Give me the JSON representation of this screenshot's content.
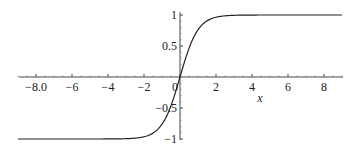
{
  "chart_data": {
    "type": "line",
    "title": "",
    "function": "tanh(x)",
    "xlabel": "x",
    "ylabel": "",
    "xlim": [
      -9,
      9
    ],
    "ylim": [
      -1,
      1
    ],
    "grid": false,
    "legend": null,
    "x_ticks": [
      -8,
      -6,
      -4,
      -2,
      0,
      2,
      4,
      6,
      8
    ],
    "x_tick_labels": [
      "-8.0",
      "-6",
      "-4",
      "-2",
      "0",
      "2",
      "4",
      "6",
      "8"
    ],
    "y_ticks": [
      -1,
      -0.5,
      0.5,
      1
    ],
    "y_tick_labels": [
      "-1",
      "-0.5",
      "0.5",
      "1"
    ],
    "series": [
      {
        "name": "tanh(x)",
        "color": "#222222",
        "x": [
          -9,
          -8,
          -6,
          -4,
          -3,
          -2,
          -1.5,
          -1,
          -0.5,
          0,
          0.5,
          1,
          1.5,
          2,
          3,
          4,
          6,
          8,
          9
        ],
        "y": [
          -1.0,
          -1.0,
          -1.0,
          -0.999,
          -0.995,
          -0.964,
          -0.905,
          -0.762,
          -0.462,
          0.0,
          0.462,
          0.762,
          0.905,
          0.964,
          0.995,
          0.999,
          1.0,
          1.0,
          1.0
        ]
      }
    ]
  },
  "colors": {
    "axis": "#444444",
    "curve": "#222222",
    "background": "#ffffff"
  }
}
